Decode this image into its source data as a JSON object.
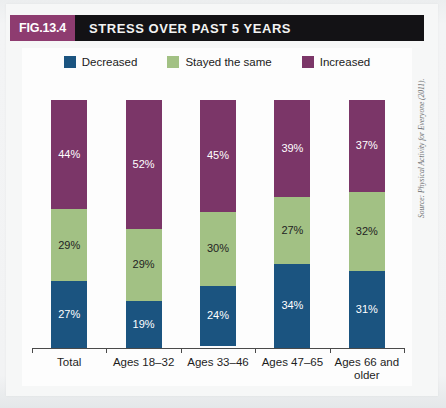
{
  "header": {
    "figure_number": "FIG.13.4",
    "title": "STRESS OVER PAST 5 YEARS"
  },
  "source_note": "Source: Physical Activity for Everyone (2011).",
  "colors": {
    "decreased": "#1b5480",
    "stayed_the_same": "#a2c184",
    "increased": "#7b3668",
    "title_bar": "#131215",
    "badge": "#8e3c70"
  },
  "chart_data": {
    "type": "bar",
    "subtype": "stacked-100-percent",
    "title": "STRESS OVER PAST 5 YEARS",
    "xlabel": "",
    "ylabel": "",
    "ylim": [
      0,
      100
    ],
    "grid": false,
    "legend_position": "top-center",
    "categories": [
      "Total",
      "Ages 18–32",
      "Ages 33–46",
      "Ages 47–65",
      "Ages 66 and older"
    ],
    "series": [
      {
        "name": "Decreased",
        "color": "#1b5480",
        "values": [
          27,
          19,
          24,
          34,
          31
        ]
      },
      {
        "name": "Stayed the same",
        "color": "#a2c184",
        "values": [
          29,
          29,
          30,
          27,
          32
        ]
      },
      {
        "name": "Increased",
        "color": "#7b3668",
        "values": [
          44,
          52,
          45,
          39,
          37
        ]
      }
    ],
    "data_labels": [
      {
        "category": "Total",
        "decreased": "27%",
        "stayed_the_same": "29%",
        "increased": "44%"
      },
      {
        "category": "Ages 18–32",
        "decreased": "19%",
        "stayed_the_same": "29%",
        "increased": "52%"
      },
      {
        "category": "Ages 33–46",
        "decreased": "24%",
        "stayed_the_same": "30%",
        "increased": "45%"
      },
      {
        "category": "Ages 47–65",
        "decreased": "34%",
        "stayed_the_same": "27%",
        "increased": "39%"
      },
      {
        "category": "Ages 66 and older",
        "decreased": "31%",
        "stayed_the_same": "32%",
        "increased": "37%"
      }
    ]
  },
  "legend": [
    {
      "label": "Decreased",
      "color": "#1b5480"
    },
    {
      "label": "Stayed the same",
      "color": "#a2c184"
    },
    {
      "label": "Increased",
      "color": "#7b3668"
    }
  ]
}
